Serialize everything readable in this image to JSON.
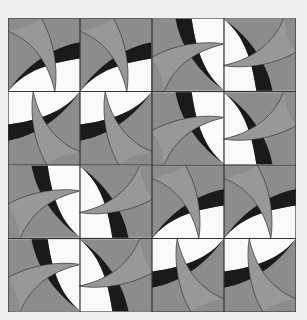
{
  "caption": "",
  "quilt": {
    "description": "4x4 quilt block pattern of curved blades",
    "rows": 4,
    "cols": 4,
    "layout": [
      [
        "r0",
        "r0",
        "r270",
        "r90"
      ],
      [
        "r180",
        "r180",
        "r270",
        "r90"
      ],
      [
        "r270",
        "r90",
        "r0",
        "r0"
      ],
      [
        "r270",
        "r90",
        "r180",
        "r180"
      ]
    ],
    "colors": {
      "background": "#8c8c8c",
      "blade": "#989898",
      "band": "#1a1a1a",
      "light": "#fafafa",
      "outline": "#333333",
      "page": "#efefef"
    }
  }
}
